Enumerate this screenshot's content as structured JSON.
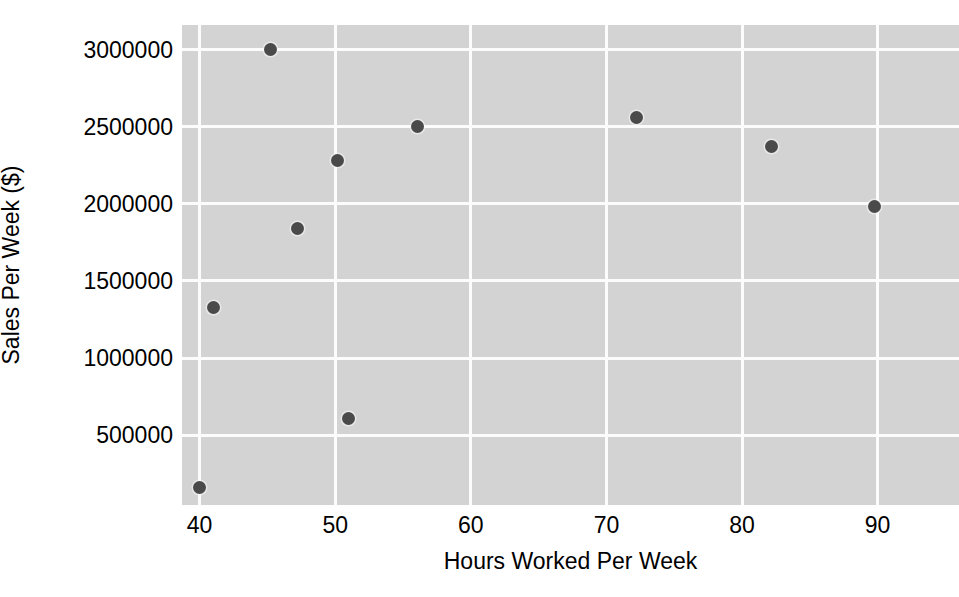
{
  "chart_data": {
    "type": "scatter",
    "title": "",
    "xlabel": "Hours Worked Per Week",
    "ylabel": "Sales Per Week ($)",
    "xlim": [
      38.7,
      96.0
    ],
    "ylim": [
      47000,
      3160000
    ],
    "grid": true,
    "legend": null,
    "xticks": [
      40,
      50,
      60,
      70,
      80,
      90
    ],
    "xtick_labels": [
      "40",
      "50",
      "60",
      "70",
      "80",
      "90"
    ],
    "yticks": [
      500000,
      1000000,
      1500000,
      2000000,
      2500000,
      3000000
    ],
    "ytick_labels": [
      "500000",
      "1000000",
      "1500000",
      "2000000",
      "2500000",
      "3000000"
    ],
    "marker": {
      "shape": "circle",
      "color": "#4a4a4a",
      "edge_color": "#fafafa",
      "size_px": 13
    },
    "panel_background": "#d3d3d3",
    "grid_color": "#fcfcfc",
    "figure_background": "#ffffff",
    "points": [
      {
        "x": 40.0,
        "y": 160000
      },
      {
        "x": 41.0,
        "y": 1330000
      },
      {
        "x": 45.2,
        "y": 3000000
      },
      {
        "x": 47.2,
        "y": 1840000
      },
      {
        "x": 50.2,
        "y": 2280000
      },
      {
        "x": 51.0,
        "y": 610000
      },
      {
        "x": 56.1,
        "y": 2500000
      },
      {
        "x": 72.2,
        "y": 2560000
      },
      {
        "x": 82.2,
        "y": 2370000
      },
      {
        "x": 89.8,
        "y": 1980000
      }
    ]
  }
}
